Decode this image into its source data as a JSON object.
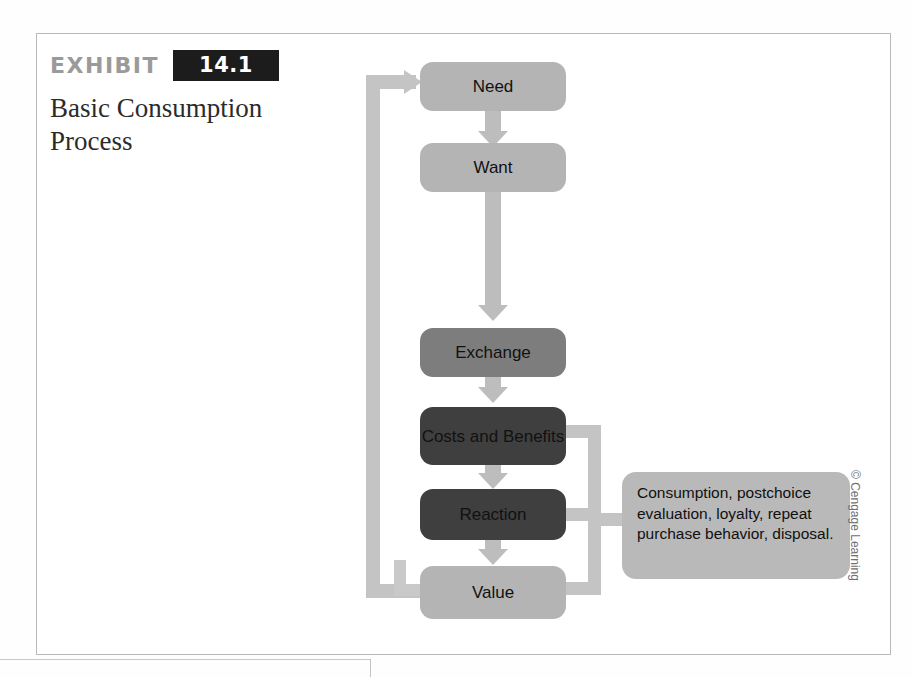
{
  "exhibit": {
    "kicker": "EXHIBIT",
    "number": "14.1",
    "title": "Basic Consumption Process"
  },
  "flow": {
    "nodes": [
      {
        "id": "need",
        "label": "Need",
        "tone": "light"
      },
      {
        "id": "want",
        "label": "Want",
        "tone": "light"
      },
      {
        "id": "exchange",
        "label": "Exchange",
        "tone": "mid"
      },
      {
        "id": "costs",
        "label": "Costs and Benefits",
        "tone": "dark"
      },
      {
        "id": "reaction",
        "label": "Reaction",
        "tone": "dark"
      },
      {
        "id": "value",
        "label": "Value",
        "tone": "light"
      }
    ],
    "callout": "Consumption, postchoice evaluation, loyalty, repeat purchase behavior, disposal."
  },
  "credit": "© Cengage Learning",
  "colors": {
    "node_light": "#b4b4b4",
    "node_mid": "#7d7d7d",
    "node_dark": "#3f3f3f",
    "connector": "#bdbdbd",
    "badge_bg": "#1c1c1c",
    "kicker": "#9a9a9a",
    "frame_border": "#b9b9b9"
  }
}
